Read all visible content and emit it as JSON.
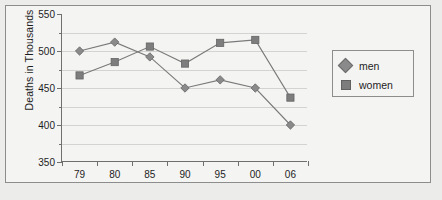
{
  "chart_data": {
    "type": "line",
    "title": "",
    "xlabel": "",
    "ylabel": "Deaths in Thousands",
    "categories": [
      "79",
      "80",
      "85",
      "90",
      "95",
      "00",
      "06"
    ],
    "ylim": [
      350,
      550
    ],
    "ytick_labels": [
      "550",
      "500",
      "450",
      "400",
      "350"
    ],
    "ytick_values": [
      550,
      500,
      450,
      400,
      350
    ],
    "yminor_values": [
      525,
      475,
      425,
      375
    ],
    "grid": true,
    "grid_values": [
      525,
      500,
      475,
      450,
      425,
      400,
      375
    ],
    "legend_position": "right",
    "series": [
      {
        "name": "men",
        "marker": "diamond",
        "color": "#8a8a8a",
        "values": [
          500,
          512,
          492,
          450,
          461,
          450,
          400
        ]
      },
      {
        "name": "women",
        "marker": "square",
        "color": "#7d7d7d",
        "values": [
          467,
          485,
          506,
          483,
          511,
          515,
          437
        ]
      }
    ]
  },
  "legend": {
    "items": [
      {
        "label": "men",
        "marker": "diamond-marker-icon"
      },
      {
        "label": "women",
        "marker": "square-marker-icon"
      }
    ]
  }
}
